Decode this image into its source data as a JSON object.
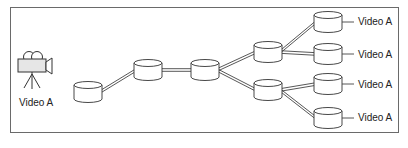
{
  "diagram": {
    "type": "video distribution tree",
    "source": {
      "label": "Video A",
      "icon": "video-camera-on-tripod"
    },
    "nodes": [
      {
        "id": "n1",
        "cx": 88,
        "cy": 92
      },
      {
        "id": "n2",
        "cx": 148,
        "cy": 70
      },
      {
        "id": "n3",
        "cx": 205,
        "cy": 70
      },
      {
        "id": "n4",
        "cx": 268,
        "cy": 52
      },
      {
        "id": "n5",
        "cx": 268,
        "cy": 90
      },
      {
        "id": "l1",
        "cx": 328,
        "cy": 22
      },
      {
        "id": "l2",
        "cx": 328,
        "cy": 54
      },
      {
        "id": "l3",
        "cx": 328,
        "cy": 84
      },
      {
        "id": "l4",
        "cx": 328,
        "cy": 118
      }
    ],
    "edges": [
      [
        "n1",
        "n2"
      ],
      [
        "n2",
        "n3"
      ],
      [
        "n3",
        "n4"
      ],
      [
        "n3",
        "n5"
      ],
      [
        "n4",
        "l1"
      ],
      [
        "n4",
        "l2"
      ],
      [
        "n5",
        "l3"
      ],
      [
        "n5",
        "l4"
      ]
    ],
    "outputs": [
      {
        "label": "Video A"
      },
      {
        "label": "Video A"
      },
      {
        "label": "Video A"
      },
      {
        "label": "Video A"
      }
    ]
  }
}
